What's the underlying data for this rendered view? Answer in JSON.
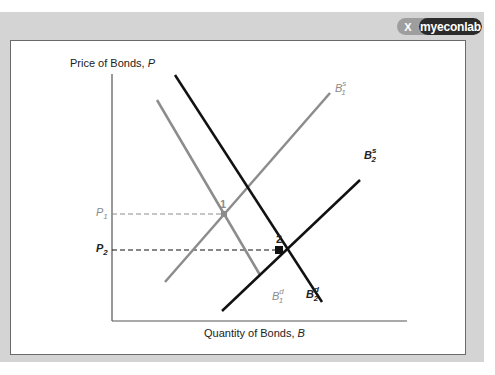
{
  "branding": {
    "logo_text": "myeconlab",
    "logo_mark": "X"
  },
  "diagram": {
    "y_axis_label": "Price of Bonds,",
    "y_axis_symbol": "P",
    "x_axis_label": "Quantity of Bonds,",
    "x_axis_symbol": "B",
    "curves": [
      {
        "id": "B1s",
        "base": "B",
        "sup": "s",
        "sub": "1",
        "color": "#8c8c8c",
        "type": "supply"
      },
      {
        "id": "B1d",
        "base": "B",
        "sup": "d",
        "sub": "1",
        "color": "#8c8c8c",
        "type": "demand"
      },
      {
        "id": "B2s",
        "base": "B",
        "sup": "s",
        "sub": "2",
        "color": "#111111",
        "type": "supply"
      },
      {
        "id": "B2d",
        "base": "B",
        "sup": "d",
        "sub": "2",
        "color": "#111111",
        "type": "demand"
      }
    ],
    "equilibria": [
      {
        "label": "1",
        "price_label_base": "P",
        "price_label_sub": "1",
        "color": "#8c8c8c"
      },
      {
        "label": "2",
        "price_label_base": "P",
        "price_label_sub": "2",
        "color": "#111111"
      }
    ]
  }
}
